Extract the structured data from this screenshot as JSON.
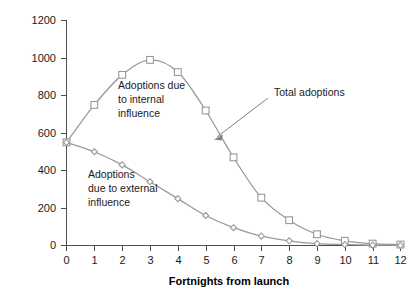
{
  "chart_data": {
    "type": "line",
    "title": "",
    "subtitle": "",
    "xlabel": "Fortnights from launch",
    "ylabel": "",
    "x": [
      0,
      1,
      2,
      3,
      4,
      5,
      6,
      7,
      8,
      9,
      10,
      11,
      12
    ],
    "xticklabels": [
      "0",
      "1",
      "2",
      "3",
      "4",
      "5",
      "6",
      "7",
      "8",
      "9",
      "10",
      "11",
      "12"
    ],
    "yticklabels": [
      "0",
      "200",
      "400",
      "600",
      "800",
      "1000",
      "1200"
    ],
    "yticks": [
      0,
      200,
      400,
      600,
      800,
      1000,
      1200
    ],
    "xlim": [
      0,
      12
    ],
    "ylim": [
      0,
      1200
    ],
    "grid": false,
    "legend_position": "annotations-inline",
    "series": [
      {
        "name": "Total adoptions",
        "marker": "square",
        "color": "#9a9a9a",
        "values": [
          550,
          750,
          910,
          990,
          925,
          720,
          470,
          255,
          135,
          60,
          25,
          10,
          5
        ]
      },
      {
        "name": "Adoptions due to external influence",
        "marker": "diamond",
        "color": "#9a9a9a",
        "values": [
          550,
          500,
          430,
          340,
          250,
          160,
          95,
          50,
          25,
          10,
          5,
          2,
          1
        ]
      }
    ],
    "annotations": [
      {
        "id": "internal-label",
        "text_lines": [
          "Adoptions due",
          "to internal",
          "influence"
        ],
        "x_px": 118,
        "y_px": 85
      },
      {
        "id": "external-label",
        "text_lines": [
          "Adoptions",
          "due to external",
          "influence"
        ],
        "x_px": 88,
        "y_px": 170
      },
      {
        "id": "total-label",
        "text_lines": [
          "Total adoptions"
        ],
        "x_px": 274,
        "y_px": 93,
        "has_leader_arrow": true
      }
    ]
  },
  "axes": {
    "y_tick_0": "0",
    "y_tick_200": "200",
    "y_tick_400": "400",
    "y_tick_600": "600",
    "y_tick_800": "800",
    "y_tick_1000": "1000",
    "y_tick_1200": "1200",
    "x_tick_0": "0",
    "x_tick_1": "1",
    "x_tick_2": "2",
    "x_tick_3": "3",
    "x_tick_4": "4",
    "x_tick_5": "5",
    "x_tick_6": "6",
    "x_tick_7": "7",
    "x_tick_8": "8",
    "x_tick_9": "9",
    "x_tick_10": "10",
    "x_tick_11": "11",
    "x_tick_12": "12",
    "x_axis_title": "Fortnights from launch"
  },
  "labels": {
    "internal_l1": "Adoptions due",
    "internal_l2": "to internal",
    "internal_l3": "influence",
    "external_l1": "Adoptions",
    "external_l2": "due to external",
    "external_l3": "influence",
    "total_l1": "Total adoptions"
  },
  "colors": {
    "line": "#9a9a9a",
    "axis": "#4d4d4d",
    "text": "#1a1a1a",
    "background": "#ffffff"
  }
}
